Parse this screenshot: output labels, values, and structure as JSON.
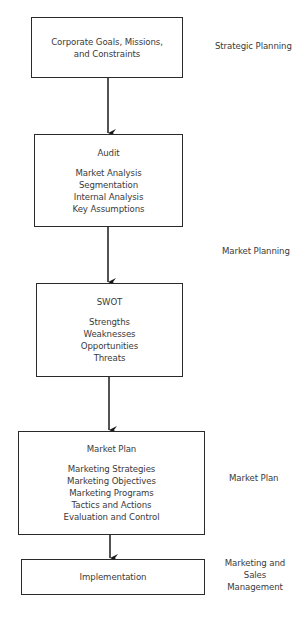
{
  "diagram": {
    "type": "flowchart",
    "direction": "top-to-bottom",
    "colors": {
      "stroke": "#2a2a2a",
      "text": "#3a3a3a",
      "background": "#ffffff"
    },
    "boxes": [
      {
        "id": "corporate",
        "title": "",
        "lines": [
          "Corporate Goals, Missions,",
          "and Constraints"
        ]
      },
      {
        "id": "audit",
        "title": "Audit",
        "lines": [
          "Market Analysis",
          "Segmentation",
          "Internal Analysis",
          "Key Assumptions"
        ]
      },
      {
        "id": "swot",
        "title": "SWOT",
        "lines": [
          "Strengths",
          "Weaknesses",
          "Opportunities",
          "Threats"
        ]
      },
      {
        "id": "market-plan",
        "title": "Market Plan",
        "lines": [
          "Marketing Strategies",
          "Marketing Objectives",
          "Marketing Programs",
          "Tactics and Actions",
          "Evaluation and Control"
        ]
      },
      {
        "id": "implementation",
        "title": "",
        "lines": [
          "Implementation"
        ]
      }
    ],
    "side_labels": [
      {
        "id": "strategic-planning",
        "lines": [
          "Strategic Planning"
        ]
      },
      {
        "id": "market-planning",
        "lines": [
          "Market Planning"
        ]
      },
      {
        "id": "market-plan",
        "lines": [
          "Market Plan"
        ]
      },
      {
        "id": "marketing-sales-mgmt",
        "lines": [
          "Marketing and",
          "Sales",
          "Management"
        ]
      }
    ],
    "arrows": [
      {
        "from": "corporate",
        "to": "audit"
      },
      {
        "from": "audit",
        "to": "swot"
      },
      {
        "from": "swot",
        "to": "market-plan"
      },
      {
        "from": "market-plan",
        "to": "implementation"
      }
    ]
  }
}
